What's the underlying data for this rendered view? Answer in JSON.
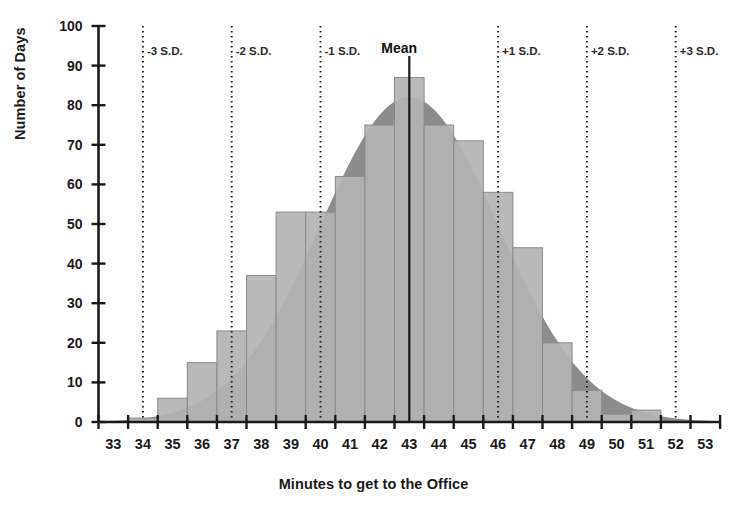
{
  "chart_data": {
    "type": "bar",
    "title": "",
    "subtitle": "",
    "xlabel": "Minutes to get to the Office",
    "ylabel": "Number of Days",
    "categories": [
      33,
      34,
      35,
      36,
      37,
      38,
      39,
      40,
      41,
      42,
      43,
      44,
      45,
      46,
      47,
      48,
      49,
      50,
      51,
      52,
      53
    ],
    "values": [
      0,
      1,
      6,
      15,
      23,
      37,
      53,
      53,
      62,
      75,
      87,
      75,
      71,
      58,
      44,
      20,
      8,
      2,
      3,
      0,
      0
    ],
    "series": [
      {
        "name": "Number of Days",
        "values": [
          0,
          1,
          6,
          15,
          23,
          37,
          53,
          53,
          62,
          75,
          87,
          75,
          71,
          58,
          44,
          20,
          8,
          2,
          3,
          0,
          0
        ]
      }
    ],
    "overlay_curve": {
      "name": "normal-distribution-curve",
      "mean": 43,
      "sd": 3,
      "peak": 82
    },
    "xlim": [
      32.5,
      53.5
    ],
    "ylim": [
      0,
      100
    ],
    "ytick_labels": [
      "0",
      "10",
      "20",
      "30",
      "40",
      "50",
      "60",
      "70",
      "80",
      "90",
      "100"
    ],
    "ytick_values": [
      0,
      10,
      20,
      30,
      40,
      50,
      60,
      70,
      80,
      90,
      100
    ],
    "xtick_labels": [
      "33",
      "34",
      "35",
      "36",
      "37",
      "38",
      "39",
      "40",
      "41",
      "42",
      "43",
      "44",
      "45",
      "46",
      "47",
      "48",
      "49",
      "50",
      "51",
      "52",
      "53"
    ],
    "grid": false,
    "legend": "none",
    "annotations": [
      {
        "label": "-3 S.D.",
        "x_value": 34,
        "type": "dotted-vertical-line"
      },
      {
        "label": "-2 S.D.",
        "x_value": 37,
        "type": "dotted-vertical-line"
      },
      {
        "label": "-1 S.D.",
        "x_value": 40,
        "type": "dotted-vertical-line"
      },
      {
        "label": "Mean",
        "x_value": 43,
        "type": "solid-vertical-line"
      },
      {
        "label": "+1 S.D.",
        "x_value": 46,
        "type": "dotted-vertical-line"
      },
      {
        "label": "+2 S.D.",
        "x_value": 49,
        "type": "dotted-vertical-line"
      },
      {
        "label": "+3 S.D.",
        "x_value": 52,
        "type": "dotted-vertical-line"
      }
    ],
    "colors": {
      "bar_fill": "#b3b3b3",
      "bar_stroke": "#8a8a8a",
      "curve_fill": "#8c8c8c",
      "axis": "#1a1a1a",
      "annotation_line": "#1a1a1a",
      "background": "#ffffff"
    }
  },
  "axis": {
    "y_title": "Number of Days",
    "x_title": "Minutes to get to the Office"
  }
}
